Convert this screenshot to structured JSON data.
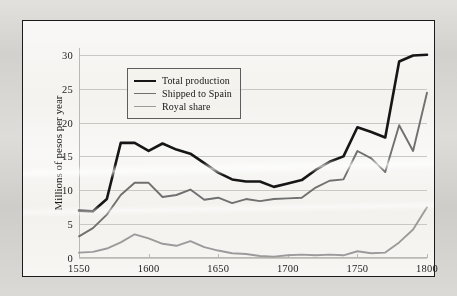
{
  "figure": {
    "background_color": "#f1f0ec",
    "frame_color": "#1b1b1b"
  },
  "chart_data": {
    "type": "line",
    "title": "",
    "xlabel": "",
    "ylabel": "Millions of pesos per year",
    "xlim": [
      1550,
      1800
    ],
    "ylim": [
      0,
      31
    ],
    "xticks": [
      1550,
      1600,
      1650,
      1700,
      1750,
      1800
    ],
    "yticks": [
      0,
      5,
      10,
      15,
      20,
      25,
      30
    ],
    "grid": "horizontal",
    "legend_position": "upper-left-inside",
    "x": [
      1550,
      1560,
      1570,
      1580,
      1590,
      1600,
      1610,
      1620,
      1630,
      1640,
      1650,
      1660,
      1670,
      1680,
      1690,
      1700,
      1710,
      1720,
      1730,
      1740,
      1750,
      1760,
      1770,
      1780,
      1790,
      1800
    ],
    "series": [
      {
        "name": "Total production",
        "color": "#161616",
        "width": 2.6,
        "values": [
          7.0,
          6.9,
          8.7,
          17.0,
          17.0,
          15.8,
          16.9,
          16.0,
          15.4,
          14.0,
          12.6,
          11.6,
          11.3,
          11.3,
          10.5,
          11.0,
          11.5,
          13.0,
          14.2,
          15.0,
          19.3,
          18.6,
          17.8,
          29.0,
          29.9,
          30.0
        ]
      },
      {
        "name": "Shipped to Spain",
        "color": "#707070",
        "width": 1.9,
        "values": [
          3.2,
          4.4,
          6.4,
          9.3,
          11.1,
          11.1,
          9.0,
          9.3,
          10.1,
          8.6,
          8.9,
          8.1,
          8.7,
          8.4,
          8.7,
          8.8,
          8.9,
          10.4,
          11.4,
          11.6,
          15.8,
          14.7,
          12.7,
          19.6,
          15.8,
          24.4
        ]
      },
      {
        "name": "Royal share",
        "color": "#9b9b9b",
        "width": 1.9,
        "values": [
          0.8,
          0.9,
          1.4,
          2.3,
          3.5,
          2.9,
          2.1,
          1.8,
          2.5,
          1.6,
          1.1,
          0.7,
          0.6,
          0.3,
          0.2,
          0.4,
          0.5,
          0.4,
          0.5,
          0.4,
          1.0,
          0.7,
          0.8,
          2.3,
          4.2,
          7.5
        ]
      }
    ]
  },
  "legend": {
    "items": [
      {
        "label": "Total production",
        "color": "#161616",
        "width": 2.6
      },
      {
        "label": "Shipped to Spain",
        "color": "#707070",
        "width": 1.9
      },
      {
        "label": "Royal share",
        "color": "#9b9b9b",
        "width": 1.9
      }
    ]
  }
}
